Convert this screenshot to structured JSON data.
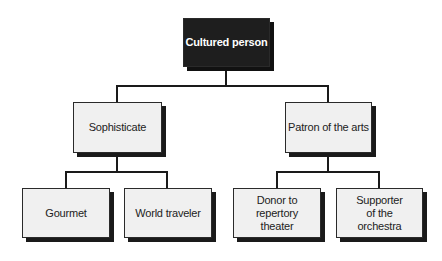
{
  "diagram": {
    "type": "hierarchy",
    "root": {
      "label": "Cultured person",
      "fill": "#1e1e1e",
      "text_color": "#ffffff"
    },
    "level1": [
      {
        "label": "Sophisticate"
      },
      {
        "label": "Patron of the arts"
      }
    ],
    "level2": [
      {
        "label": "Gourmet",
        "parent": "Sophisticate"
      },
      {
        "label": "World traveler",
        "parent": "Sophisticate"
      },
      {
        "label": "Donor to\nrepertory\ntheater",
        "parent": "Patron of the arts"
      },
      {
        "label": "Supporter\nof the\norchestra",
        "parent": "Patron of the arts"
      }
    ],
    "colors": {
      "box_fill": "#f0f0f0",
      "line": "#1a1a1a",
      "shadow": "#1a1a1a"
    }
  }
}
